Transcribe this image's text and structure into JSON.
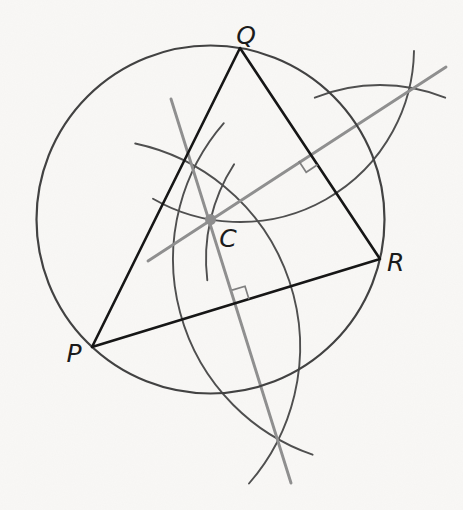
{
  "figure": {
    "canvas": {
      "width": 463,
      "height": 510
    },
    "background": "#f9f8f6",
    "label_color": "#1b1b1b",
    "labels": {
      "P": "P",
      "Q": "Q",
      "R": "R",
      "C": "C"
    },
    "label_positions": {
      "P": {
        "x": 74,
        "y": 362,
        "anchor": "middle"
      },
      "Q": {
        "x": 246,
        "y": 44,
        "anchor": "middle"
      },
      "R": {
        "x": 387,
        "y": 271,
        "anchor": "start"
      },
      "C": {
        "x": 228,
        "y": 247,
        "anchor": "middle"
      }
    },
    "points": {
      "P": {
        "x": 92,
        "y": 347
      },
      "Q": {
        "x": 240,
        "y": 48
      },
      "R": {
        "x": 380,
        "y": 259
      },
      "C": {
        "x": 210.5,
        "y": 219.5
      }
    },
    "circumcircle": {
      "cx": 210.5,
      "cy": 219.5,
      "r": 174,
      "color": "#424242",
      "width": 2.2
    },
    "triangle": {
      "color": "#161616",
      "width": 2.6
    },
    "center_dot": {
      "r": 5.5,
      "color": "#8d8d8d"
    },
    "bisectors": {
      "color": "#8f8f8f",
      "width": 2.9,
      "lines": [
        {
          "name": "perp-bisector-QR",
          "x1": 148,
          "y1": 261,
          "x2": 446,
          "y2": 67
        },
        {
          "name": "perp-bisector-PR",
          "x1": 171,
          "y1": 99,
          "x2": 291,
          "y2": 483
        }
      ]
    },
    "construction_arcs": {
      "color": "#4f4f4f",
      "width": 1.9,
      "arcs": [
        {
          "name": "arc-center-Q",
          "cx": 240,
          "cy": 48,
          "r": 174,
          "start": 1,
          "end": 120
        },
        {
          "name": "arc-center-R-upper",
          "cx": 380,
          "cy": 259,
          "r": 174,
          "start": 248,
          "end": 292
        },
        {
          "name": "arc-center-R-at-C",
          "cx": 380,
          "cy": 259,
          "r": 174,
          "start": 173,
          "end": 213
        },
        {
          "name": "arc-center-P",
          "cx": 92,
          "cy": 347,
          "r": 208,
          "start": -78,
          "end": 41
        },
        {
          "name": "arc-center-R-lower",
          "cx": 380,
          "cy": 259,
          "r": 207,
          "start": 109,
          "end": 221
        }
      ]
    },
    "right_angle_marks": {
      "color": "#7f7f7f",
      "width": 1.7,
      "size": 13.5,
      "marks": [
        {
          "name": "right-angle-mark-QR",
          "mx": 310,
          "my": 153.5,
          "ux": 0.553,
          "uy": 0.833,
          "vx": -0.833,
          "vy": 0.553
        },
        {
          "name": "right-angle-mark-PR",
          "mx": 236,
          "my": 303,
          "ux": 0.956,
          "uy": -0.292,
          "vx": -0.292,
          "vy": -0.956
        }
      ]
    }
  }
}
